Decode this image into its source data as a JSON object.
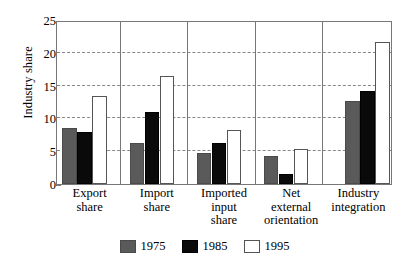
{
  "chart_data": {
    "type": "bar",
    "title": "",
    "xlabel": "",
    "ylabel": "Industry share",
    "ylim": [
      0,
      25
    ],
    "yticks": [
      0,
      5,
      10,
      15,
      20,
      25
    ],
    "ytick_labels": [
      "0",
      "5",
      "10",
      "15",
      "20",
      "25"
    ],
    "grid": true,
    "grid_axis": "y",
    "legend_position": "bottom-center",
    "categories": [
      "Export share",
      "Import share",
      "Imported input share",
      "Net external orientation",
      "Industry integration"
    ],
    "category_lines": [
      [
        "Export",
        "share"
      ],
      [
        "Import",
        "share"
      ],
      [
        "Imported",
        "input",
        "share"
      ],
      [
        "Net",
        "external",
        "orientation"
      ],
      [
        "Industry",
        "integration"
      ]
    ],
    "series": [
      {
        "name": "1975",
        "color": "#5a5a5a",
        "values": [
          8.5,
          6.3,
          4.8,
          4.3,
          12.6
        ]
      },
      {
        "name": "1985",
        "color": "#0a0a0a",
        "values": [
          8.0,
          11.0,
          6.2,
          1.5,
          14.2
        ]
      },
      {
        "name": "1995",
        "color": "#ffffff",
        "values": [
          13.4,
          16.4,
          8.3,
          5.4,
          21.6
        ]
      }
    ]
  },
  "legend": {
    "entries": [
      {
        "label": "1975",
        "swatch": "series-1975-swatch"
      },
      {
        "label": "1985",
        "swatch": "series-1985-swatch"
      },
      {
        "label": "1995",
        "swatch": "series-1995-swatch"
      }
    ]
  },
  "colors": {
    "series_1975": "#5a5a5a",
    "series_1985": "#0a0a0a",
    "series_1995": "#ffffff",
    "axis": "#777777",
    "gridline": "#888888",
    "background": "#ffffff",
    "text": "#000000"
  }
}
